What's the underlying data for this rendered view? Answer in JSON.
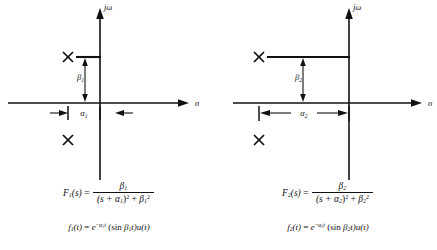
{
  "figure": {
    "type": "s-plane pole plots with Laplace transform pairs",
    "panels": [
      {
        "id": "left",
        "axis_labels": {
          "vertical": "jω",
          "horizontal": "σ"
        },
        "annotations": {
          "beta": "β₁",
          "alpha": "α₁"
        },
        "poles": [
          {
            "marker": "X",
            "quadrant": "upper-left",
            "real": -0.33,
            "imag": 0.52
          },
          {
            "marker": "X",
            "quadrant": "lower-left",
            "real": -0.33,
            "imag": -0.52
          }
        ],
        "equations": {
          "transform_lhs": "F₁(s)",
          "transform_numerator": "β₁",
          "transform_denominator": "(s + α₁)² + β₁²",
          "time_domain": "f₁(t) = e^(−α₁t) (sin β₁t)u(t)"
        },
        "eq_parts": {
          "F": "F",
          "F_sub": "1",
          "F_arg": "(s)",
          "eq": "=",
          "num_sym": "β",
          "num_sub": "1",
          "den_open": "(s + ",
          "den_alpha": "α",
          "den_alpha_sub": "1",
          "den_close": ")",
          "den_pow": "2",
          "den_plus": " + ",
          "den_beta": "β",
          "den_beta_sub": "1",
          "den_beta_pow": "2",
          "t_f": "f",
          "t_f_sub": "1",
          "t_f_arg": "(t)",
          "t_eq": "=",
          "t_e": "e",
          "t_e_exp_minus": "−",
          "t_e_exp_a": "α",
          "t_e_exp_sub": "1",
          "t_e_exp_t": "t",
          "t_sin": "(sin ",
          "t_beta": "β",
          "t_beta_sub": "1",
          "t_tail": "t)u(t)"
        }
      },
      {
        "id": "right",
        "axis_labels": {
          "vertical": "jω",
          "horizontal": "σ"
        },
        "annotations": {
          "beta": "β₂",
          "alpha": "α₂"
        },
        "poles": [
          {
            "marker": "X",
            "quadrant": "upper-left",
            "real": -0.66,
            "imag": 0.52
          },
          {
            "marker": "X",
            "quadrant": "lower-left",
            "real": -0.66,
            "imag": -0.52
          }
        ],
        "equations": {
          "transform_lhs": "F₂(s)",
          "transform_numerator": "β₂",
          "transform_denominator": "(s + α₂)² + β₂²",
          "time_domain": "f₂(t) = e^(−α₂t) (sin β₂t)u(t)"
        },
        "eq_parts": {
          "F": "F",
          "F_sub": "2",
          "F_arg": "(s)",
          "eq": "=",
          "num_sym": "β",
          "num_sub": "2",
          "den_open": "(s + ",
          "den_alpha": "α",
          "den_alpha_sub": "2",
          "den_close": ")",
          "den_pow": "2",
          "den_plus": " + ",
          "den_beta": "β",
          "den_beta_sub": "2",
          "den_beta_pow": "2",
          "t_f": "f",
          "t_f_sub": "2",
          "t_f_arg": "(t)",
          "t_eq": "=",
          "t_e": "e",
          "t_e_exp_minus": "−",
          "t_e_exp_a": "α",
          "t_e_exp_sub": "2",
          "t_e_exp_t": "t",
          "t_sin": "(sin ",
          "t_beta": "β",
          "t_beta_sub": "2",
          "t_tail": "t)u(t)"
        }
      }
    ],
    "colors": {
      "ink": "#111111",
      "background": "#ffffff"
    }
  }
}
